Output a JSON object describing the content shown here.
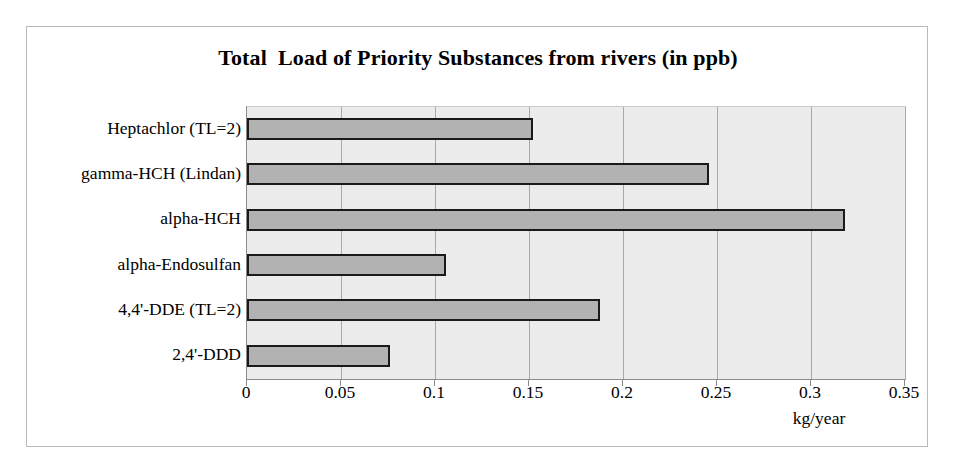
{
  "chart_data": {
    "type": "bar",
    "orientation": "horizontal",
    "title": "Total  Load of Priority Substances from rivers (in ppb)",
    "categories": [
      "Heptachlor (TL=2)",
      "gamma-HCH (Lindan)",
      "alpha-HCH",
      "alpha-Endosulfan",
      "4,4'-DDE (TL=2)",
      "2,4'-DDD"
    ],
    "values": [
      0.152,
      0.246,
      0.318,
      0.106,
      0.188,
      0.076
    ],
    "xlabel": "kg/year",
    "ylabel": "",
    "xlim": [
      0,
      0.35
    ],
    "xticks": [
      "0",
      "0.05",
      "0.1",
      "0.15",
      "0.2",
      "0.25",
      "0.3",
      "0.35"
    ],
    "xtick_values": [
      0,
      0.05,
      0.1,
      0.15,
      0.2,
      0.25,
      0.3,
      0.35
    ],
    "grid": true,
    "legend": false,
    "colors": {
      "bar_fill": "#b2b2b2",
      "bar_edge": "#1a1a1a",
      "plot_background": "#ececec",
      "gridline": "#a9a9a9",
      "frame": "#b9b9b9",
      "text": "#000000"
    }
  }
}
